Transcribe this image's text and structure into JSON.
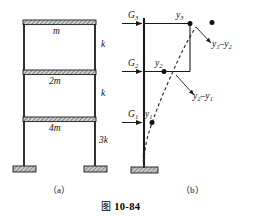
{
  "figure": {
    "number": "图 10-84",
    "number_cjk": "图",
    "number_text": "10-84"
  },
  "panel_a": {
    "caption": "（a）",
    "masses": [
      {
        "id": "mass-top",
        "label": "m"
      },
      {
        "id": "mass-middle",
        "label": "2m"
      },
      {
        "id": "mass-bottom",
        "label": "4m"
      }
    ],
    "stiffnesses": [
      {
        "id": "stiffness-story-3",
        "label": "k"
      },
      {
        "id": "stiffness-story-2",
        "label": "k"
      },
      {
        "id": "stiffness-story-1",
        "label": "3k"
      }
    ]
  },
  "panel_b": {
    "caption": "（b）",
    "forces": [
      {
        "id": "force-level-3",
        "label": "G",
        "sub": "3"
      },
      {
        "id": "force-level-2",
        "label": "G",
        "sub": "2"
      },
      {
        "id": "force-level-1",
        "label": "G",
        "sub": "1"
      }
    ],
    "displacements": [
      {
        "id": "disp-level-3",
        "label": "y",
        "sub": "3"
      },
      {
        "id": "disp-level-2",
        "label": "y",
        "sub": "2"
      },
      {
        "id": "disp-level-1",
        "label": "y",
        "sub": "1"
      }
    ],
    "drifts": [
      {
        "id": "drift-3-2",
        "text": "y₃–y₂"
      },
      {
        "id": "drift-2-1",
        "text": "y₂–y₁"
      }
    ]
  },
  "colors": {
    "line": "#1a1a1a",
    "hatch_fill": "#b0b0b0",
    "ground_fill": "#9a9a9a",
    "dashed": "#2a2a2a"
  }
}
